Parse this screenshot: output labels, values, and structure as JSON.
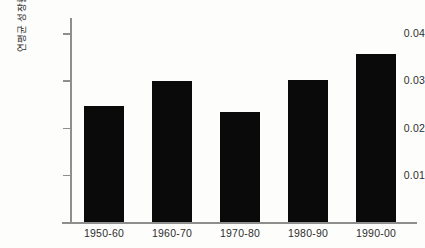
{
  "chart_data": {
    "type": "bar",
    "title": "",
    "subtitle": "",
    "xlabel": "",
    "ylabel": "연평균 성장률",
    "categories": [
      "1950-60",
      "1960-70",
      "1970-80",
      "1980-90",
      "1990-00"
    ],
    "values": [
      0.0246,
      0.0298,
      0.0234,
      0.03,
      0.0355
    ],
    "series": [
      {
        "name": "연평균 성장률",
        "values": [
          0.0246,
          0.0298,
          0.0234,
          0.03,
          0.0355
        ]
      }
    ],
    "ylim": [
      0,
      0.0432
    ],
    "xlim": [
      0,
      5
    ],
    "y_ticks": [
      0.01,
      0.02,
      0.03,
      0.04
    ],
    "y_tick_labels": [
      "0.01",
      "0.02",
      "0.03",
      "0.04"
    ],
    "grid": false,
    "legend": false,
    "legend_position": "none",
    "bar_color": "#0a0a0a",
    "axis_color": "#8e8e8e",
    "text_color": "#2d2d2d",
    "background_color": "#fdfdfc",
    "annotations": []
  }
}
